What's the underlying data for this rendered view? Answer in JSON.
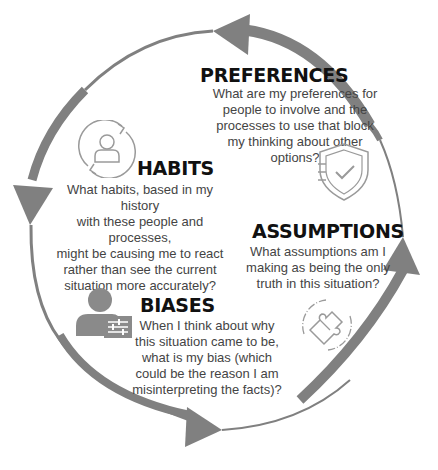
{
  "colors": {
    "arrow": "#808080",
    "title": "#111111",
    "text": "#444444",
    "icon": "#9a9a9a"
  },
  "sections": {
    "preferences": {
      "title": "PREFERENCES",
      "lines": [
        "What are my preferences for",
        "people to involve and the",
        "processes to use that block",
        "my thinking about other",
        "options?"
      ],
      "icon": "shield-check-icon"
    },
    "habits": {
      "title": "HABITS",
      "lines": [
        "What habits, based in my history",
        "with these people and processes,",
        "might be causing me to react",
        "rather than see the current",
        "situation more accurately?"
      ],
      "icon": "person-cycle-icon"
    },
    "assumptions": {
      "title": "ASSUMPTIONS",
      "lines": [
        "What assumptions am I",
        "making as being the only",
        "truth in this situation?"
      ],
      "icon": "puzzle-icon"
    },
    "biases": {
      "title": "BIASES",
      "lines": [
        "When I think about why",
        "this situation came to be,",
        "what is my bias (which",
        "could be the reason I am",
        "misinterpreting the facts)?"
      ],
      "icon": "person-sliders-icon"
    }
  }
}
